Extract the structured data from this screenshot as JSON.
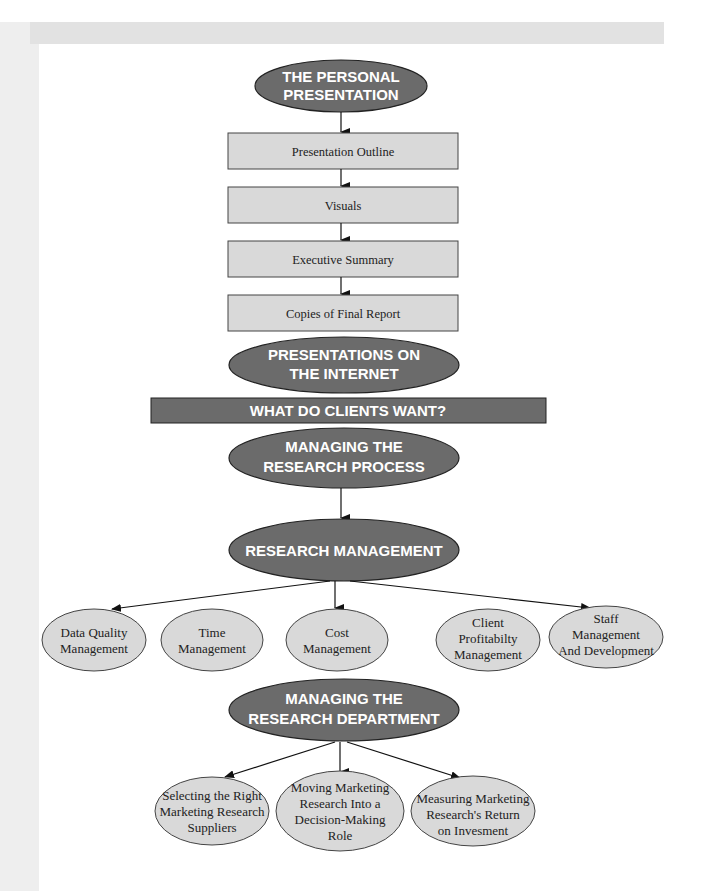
{
  "diagram": {
    "top_oval": {
      "lines": [
        "THE PERSONAL",
        "PRESENTATION"
      ]
    },
    "steps": [
      {
        "label": "Presentation Outline"
      },
      {
        "label": "Visuals"
      },
      {
        "label": "Executive Summary"
      },
      {
        "label": "Copies of Final Report"
      }
    ],
    "internet_oval": {
      "lines": [
        "PRESENTATIONS ON",
        "THE INTERNET"
      ]
    },
    "banner": {
      "label": "WHAT DO CLIENTS WANT?"
    },
    "process_oval": {
      "lines": [
        "MANAGING THE",
        "RESEARCH PROCESS"
      ]
    },
    "management_oval": {
      "lines": [
        "RESEARCH MANAGEMENT"
      ]
    },
    "management_children": [
      {
        "lines": [
          "Data Quality",
          "Management"
        ]
      },
      {
        "lines": [
          "Time",
          "Management"
        ]
      },
      {
        "lines": [
          "Cost",
          "Management"
        ]
      },
      {
        "lines": [
          "Client",
          "Profitabilty",
          "Management"
        ]
      },
      {
        "lines": [
          "Staff",
          "Management",
          "And Development"
        ]
      }
    ],
    "department_oval": {
      "lines": [
        "MANAGING THE",
        "RESEARCH DEPARTMENT"
      ]
    },
    "department_children": [
      {
        "lines": [
          "Selecting the Right",
          "Marketing Research",
          "Suppliers"
        ]
      },
      {
        "lines": [
          "Moving Marketing",
          "Research Into a",
          "Decision-Making",
          "Role"
        ]
      },
      {
        "lines": [
          "Measuring Marketing",
          "Research's Return",
          "on Invesment"
        ]
      }
    ],
    "colors": {
      "dark_oval": "#6b6b6b",
      "light_fill": "#d9d9d9",
      "outline": "#333333",
      "header_bar": "#e2e2e2",
      "left_band": "#eeeeee"
    }
  }
}
